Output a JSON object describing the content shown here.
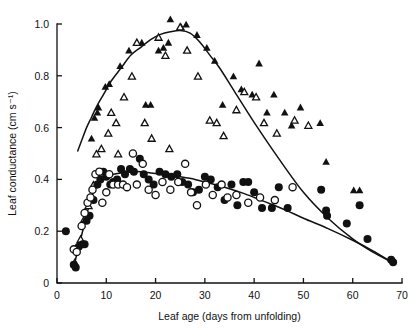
{
  "figure": {
    "background_color": "#ffffff",
    "ink_color": "#111111"
  },
  "chart_data": {
    "type": "scatter",
    "title": "",
    "subtitle": "",
    "xlabel": "Leaf age (days from unfolding)",
    "ylabel": "Leaf conductance (cm s⁻¹)",
    "xlim": [
      0,
      70
    ],
    "ylim": [
      0,
      1.05
    ],
    "xticks": [
      0,
      10,
      20,
      30,
      40,
      50,
      60,
      70
    ],
    "xtick_labels": [
      "0",
      "10",
      "20",
      "30",
      "40",
      "50",
      "60",
      "70"
    ],
    "yticks": [
      0,
      0.2,
      0.4,
      0.6,
      0.8,
      1.0
    ],
    "ytick_labels": [
      "0",
      "0.2",
      "0.4",
      "0.6",
      "0.8",
      "1.0"
    ],
    "grid": false,
    "legend_position": "none",
    "legend": [],
    "annotations": [],
    "series": [
      {
        "name": "filled-triangle",
        "marker": "triangle-filled",
        "points": [
          [
            7.0,
            0.56
          ],
          [
            7.6,
            0.64
          ],
          [
            8.2,
            0.66
          ],
          [
            8.4,
            0.68
          ],
          [
            9.8,
            0.76
          ],
          [
            10.6,
            0.77
          ],
          [
            12.8,
            0.84
          ],
          [
            14.6,
            0.9
          ],
          [
            17.2,
            0.93
          ],
          [
            18.0,
            0.69
          ],
          [
            19.0,
            0.69
          ],
          [
            20.6,
            0.9
          ],
          [
            21.6,
            0.91
          ],
          [
            22.6,
            0.93
          ],
          [
            23.0,
            1.02
          ],
          [
            25.2,
            0.99
          ],
          [
            26.2,
            1.0
          ],
          [
            28.4,
            0.96
          ],
          [
            30.4,
            0.91
          ],
          [
            32.0,
            0.86
          ],
          [
            33.6,
            0.69
          ],
          [
            35.8,
            0.8
          ],
          [
            37.4,
            0.75
          ],
          [
            39.6,
            0.73
          ],
          [
            41.0,
            0.85
          ],
          [
            42.6,
            0.66
          ],
          [
            44.0,
            0.73
          ],
          [
            46.2,
            0.66
          ],
          [
            47.6,
            0.61
          ],
          [
            49.4,
            0.68
          ],
          [
            53.4,
            0.62
          ],
          [
            54.6,
            0.47
          ],
          [
            60.2,
            0.36
          ],
          [
            61.4,
            0.36
          ]
        ]
      },
      {
        "name": "open-triangle",
        "marker": "triangle-open",
        "points": [
          [
            3.6,
            0.08
          ],
          [
            4.8,
            0.17
          ],
          [
            5.6,
            0.25
          ],
          [
            6.4,
            0.3
          ],
          [
            7.4,
            0.38
          ],
          [
            8.0,
            0.5
          ],
          [
            9.0,
            0.52
          ],
          [
            10.4,
            0.58
          ],
          [
            11.0,
            0.66
          ],
          [
            12.0,
            0.62
          ],
          [
            12.4,
            0.5
          ],
          [
            13.6,
            0.72
          ],
          [
            15.2,
            0.8
          ],
          [
            16.2,
            0.93
          ],
          [
            17.8,
            0.62
          ],
          [
            19.2,
            0.56
          ],
          [
            20.6,
            0.95
          ],
          [
            22.0,
            0.88
          ],
          [
            22.8,
            0.52
          ],
          [
            25.0,
            0.99
          ],
          [
            26.4,
            0.9
          ],
          [
            28.6,
            0.8
          ],
          [
            31.0,
            0.63
          ],
          [
            32.4,
            0.62
          ],
          [
            33.8,
            0.57
          ],
          [
            36.4,
            0.67
          ],
          [
            38.0,
            0.74
          ],
          [
            40.4,
            0.72
          ],
          [
            42.0,
            0.62
          ],
          [
            44.6,
            0.58
          ],
          [
            48.2,
            0.63
          ],
          [
            51.0,
            0.61
          ]
        ]
      },
      {
        "name": "filled-circle",
        "marker": "circle-filled",
        "points": [
          [
            1.8,
            0.2
          ],
          [
            3.4,
            0.07
          ],
          [
            3.8,
            0.06
          ],
          [
            4.4,
            0.14
          ],
          [
            5.2,
            0.15
          ],
          [
            5.6,
            0.15
          ],
          [
            6.0,
            0.24
          ],
          [
            6.6,
            0.26
          ],
          [
            7.4,
            0.32
          ],
          [
            8.2,
            0.38
          ],
          [
            8.8,
            0.4
          ],
          [
            9.4,
            0.43
          ],
          [
            10.0,
            0.41
          ],
          [
            10.8,
            0.38
          ],
          [
            11.4,
            0.39
          ],
          [
            12.2,
            0.4
          ],
          [
            13.0,
            0.44
          ],
          [
            13.8,
            0.42
          ],
          [
            14.8,
            0.44
          ],
          [
            15.6,
            0.43
          ],
          [
            16.8,
            0.48
          ],
          [
            17.6,
            0.42
          ],
          [
            18.6,
            0.4
          ],
          [
            19.6,
            0.38
          ],
          [
            20.8,
            0.43
          ],
          [
            22.0,
            0.42
          ],
          [
            23.2,
            0.41
          ],
          [
            24.4,
            0.42
          ],
          [
            25.4,
            0.39
          ],
          [
            26.6,
            0.38
          ],
          [
            27.6,
            0.35
          ],
          [
            28.8,
            0.36
          ],
          [
            30.0,
            0.41
          ],
          [
            31.2,
            0.4
          ],
          [
            32.6,
            0.37
          ],
          [
            34.0,
            0.32
          ],
          [
            35.4,
            0.38
          ],
          [
            36.6,
            0.3
          ],
          [
            37.8,
            0.39
          ],
          [
            38.8,
            0.39
          ],
          [
            40.0,
            0.35
          ],
          [
            41.6,
            0.29
          ],
          [
            43.6,
            0.29
          ],
          [
            45.0,
            0.37
          ],
          [
            46.8,
            0.29
          ],
          [
            53.6,
            0.36
          ],
          [
            54.6,
            0.28
          ],
          [
            54.8,
            0.26
          ],
          [
            58.8,
            0.23
          ],
          [
            61.4,
            0.3
          ],
          [
            63.0,
            0.17
          ],
          [
            67.8,
            0.09
          ],
          [
            68.2,
            0.08
          ]
        ]
      },
      {
        "name": "open-circle",
        "marker": "circle-open",
        "points": [
          [
            3.4,
            0.13
          ],
          [
            4.0,
            0.12
          ],
          [
            5.0,
            0.22
          ],
          [
            5.6,
            0.27
          ],
          [
            6.2,
            0.31
          ],
          [
            6.8,
            0.33
          ],
          [
            7.2,
            0.36
          ],
          [
            7.8,
            0.42
          ],
          [
            8.6,
            0.43
          ],
          [
            9.2,
            0.31
          ],
          [
            10.0,
            0.35
          ],
          [
            10.6,
            0.42
          ],
          [
            11.4,
            0.38
          ],
          [
            12.4,
            0.38
          ],
          [
            13.4,
            0.38
          ],
          [
            14.2,
            0.37
          ],
          [
            15.4,
            0.5
          ],
          [
            16.2,
            0.38
          ],
          [
            17.4,
            0.46
          ],
          [
            18.6,
            0.36
          ],
          [
            20.0,
            0.34
          ],
          [
            21.4,
            0.39
          ],
          [
            23.0,
            0.36
          ],
          [
            24.6,
            0.39
          ],
          [
            26.0,
            0.46
          ],
          [
            27.2,
            0.35
          ],
          [
            28.4,
            0.3
          ],
          [
            30.2,
            0.38
          ],
          [
            31.6,
            0.34
          ],
          [
            33.4,
            0.38
          ],
          [
            34.6,
            0.33
          ],
          [
            36.4,
            0.34
          ],
          [
            38.8,
            0.31
          ],
          [
            41.2,
            0.33
          ],
          [
            44.2,
            0.32
          ],
          [
            47.8,
            0.37
          ]
        ]
      }
    ],
    "fit_curves": [
      {
        "name": "triangle-fit-curve",
        "description": "rise to peak near day 25 then linear decline",
        "points": [
          [
            4.2,
            0.51
          ],
          [
            5.0,
            0.55
          ],
          [
            6.0,
            0.6
          ],
          [
            7.0,
            0.64
          ],
          [
            8.0,
            0.68
          ],
          [
            9.5,
            0.73
          ],
          [
            11.0,
            0.78
          ],
          [
            13.0,
            0.83
          ],
          [
            15.0,
            0.88
          ],
          [
            17.0,
            0.91
          ],
          [
            19.0,
            0.94
          ],
          [
            21.0,
            0.96
          ],
          [
            23.0,
            0.97
          ],
          [
            25.0,
            0.975
          ],
          [
            27.0,
            0.965
          ],
          [
            29.0,
            0.93
          ],
          [
            31.0,
            0.88
          ],
          [
            33.0,
            0.83
          ],
          [
            36.0,
            0.74
          ],
          [
            40.0,
            0.62
          ],
          [
            45.0,
            0.48
          ],
          [
            50.0,
            0.35
          ],
          [
            55.0,
            0.25
          ],
          [
            60.0,
            0.17
          ],
          [
            64.0,
            0.12
          ],
          [
            68.0,
            0.08
          ]
        ]
      },
      {
        "name": "circle-fit-curve",
        "description": "steep rise to plateau near 0.43 then gentle decline",
        "points": [
          [
            3.4,
            0.06
          ],
          [
            4.0,
            0.11
          ],
          [
            4.8,
            0.17
          ],
          [
            5.6,
            0.23
          ],
          [
            6.4,
            0.29
          ],
          [
            7.2,
            0.34
          ],
          [
            8.0,
            0.38
          ],
          [
            9.0,
            0.4
          ],
          [
            10.0,
            0.41
          ],
          [
            11.5,
            0.42
          ],
          [
            13.0,
            0.425
          ],
          [
            15.0,
            0.43
          ],
          [
            17.0,
            0.43
          ],
          [
            19.0,
            0.425
          ],
          [
            21.0,
            0.42
          ],
          [
            23.0,
            0.415
          ],
          [
            25.0,
            0.41
          ],
          [
            28.0,
            0.4
          ],
          [
            31.0,
            0.385
          ],
          [
            34.0,
            0.37
          ],
          [
            38.0,
            0.345
          ],
          [
            42.0,
            0.315
          ],
          [
            46.0,
            0.285
          ],
          [
            50.0,
            0.25
          ],
          [
            55.0,
            0.21
          ],
          [
            60.0,
            0.165
          ],
          [
            64.0,
            0.125
          ],
          [
            68.0,
            0.08
          ]
        ]
      }
    ]
  }
}
